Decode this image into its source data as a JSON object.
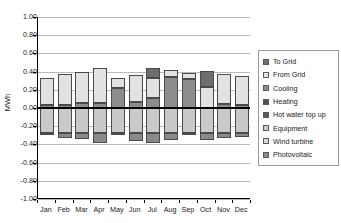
{
  "chart_data": {
    "type": "bar",
    "subtype": "stacked-bar-diverging",
    "title": "",
    "xlabel": "",
    "ylabel": "MWh",
    "categories": [
      "Jan",
      "Feb",
      "Mar",
      "Apr",
      "May",
      "Jun",
      "Jul",
      "Aug",
      "Sep",
      "Oct",
      "Nov",
      "Dec"
    ],
    "ylim": [
      -1.0,
      1.0
    ],
    "ytick_labels": [
      "1.00",
      "0.80",
      "0.60",
      "0.40",
      "0.20",
      "0.00",
      "-0.20",
      "-0.40",
      "-0.60",
      "-0.80",
      "-1.00"
    ],
    "ytick_values": [
      1.0,
      0.8,
      0.6,
      0.4,
      0.2,
      0.0,
      -0.2,
      -0.4,
      -0.6,
      -0.8,
      -1.0
    ],
    "grid": true,
    "legend_position": "right",
    "series": [
      {
        "name": "To Grid",
        "color": "#6e6e6e",
        "values": [
          0.0,
          0.0,
          0.0,
          0.0,
          0.0,
          0.0,
          0.11,
          0.0,
          0.0,
          0.18,
          0.0,
          0.0
        ]
      },
      {
        "name": "From Grid",
        "color": "#e2e2e2",
        "values": [
          0.3,
          0.34,
          0.35,
          0.38,
          0.11,
          0.29,
          0.22,
          0.08,
          0.07,
          0.23,
          0.33,
          0.32
        ]
      },
      {
        "name": "Cooling",
        "color": "#8c8c8c",
        "values": [
          0.03,
          0.03,
          0.05,
          0.06,
          0.22,
          0.07,
          0.11,
          0.34,
          0.32,
          0.0,
          0.04,
          0.03
        ]
      },
      {
        "name": "Heating",
        "color": "#4f4f4f",
        "values": [
          0.0,
          0.0,
          0.0,
          0.0,
          0.0,
          0.0,
          0.0,
          0.0,
          0.0,
          0.0,
          0.0,
          0.0
        ]
      },
      {
        "name": "Hot water top up",
        "color": "#5a5a5a",
        "values": [
          0.0,
          0.0,
          0.0,
          0.0,
          0.0,
          0.0,
          0.0,
          0.0,
          0.0,
          0.0,
          0.0,
          0.0
        ]
      },
      {
        "name": "Equipment",
        "color": "#c9c9c9",
        "values": [
          -0.28,
          -0.28,
          -0.28,
          -0.28,
          -0.28,
          -0.28,
          -0.28,
          -0.28,
          -0.28,
          -0.28,
          -0.28,
          -0.28
        ]
      },
      {
        "name": "Wind turbine",
        "color": "#d8d8d8",
        "values": [
          0.0,
          0.0,
          0.0,
          0.0,
          0.0,
          0.0,
          0.0,
          0.0,
          0.0,
          0.0,
          0.0,
          0.0
        ]
      },
      {
        "name": "Photovoltaic",
        "color": "#8a8a8a",
        "values": [
          -0.02,
          -0.05,
          -0.06,
          -0.11,
          -0.02,
          -0.08,
          -0.11,
          -0.07,
          -0.02,
          -0.07,
          -0.05,
          -0.04
        ]
      }
    ]
  },
  "legend": {
    "items": [
      {
        "label": "To Grid",
        "color": "#6e6e6e"
      },
      {
        "label": "From Grid",
        "color": "#e2e2e2"
      },
      {
        "label": "Cooling",
        "color": "#8c8c8c"
      },
      {
        "label": "Heating",
        "color": "#4f4f4f"
      },
      {
        "label": "Hot water top up",
        "color": "#5a5a5a"
      },
      {
        "label": "Equipment",
        "color": "#c9c9c9"
      },
      {
        "label": "Wind turbine",
        "color": "#d8d8d8"
      },
      {
        "label": "Photovoltaic",
        "color": "#8a8a8a"
      }
    ]
  }
}
